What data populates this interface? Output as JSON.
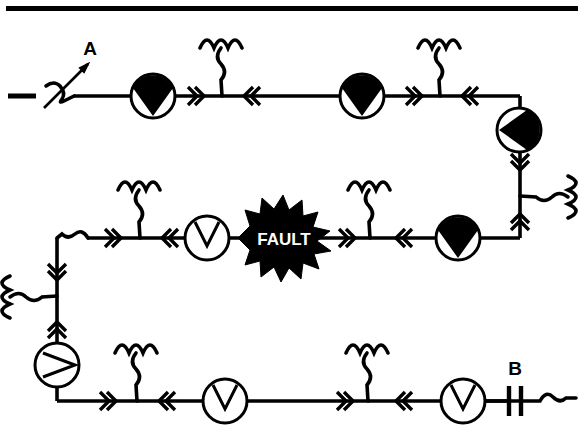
{
  "figure": {
    "type": "single-line-power-distribution-diagram",
    "title": "",
    "width": 584,
    "height": 433,
    "background_color": "#ffffff",
    "line_color": "#000000",
    "border": {
      "top_rule": true,
      "color": "#000000"
    }
  },
  "labels": {
    "switch_a": "A",
    "switch_b": "B",
    "fault": "FAULT"
  },
  "colors": {
    "stroke": "#000000",
    "fill_marker": "#000000",
    "open_marker": "#ffffff",
    "fault_fill": "#000000",
    "fault_text": "#ffffff"
  },
  "legend_semantics": {
    "filled_wedge_circle": "closed / energized switchgear",
    "open_wedge_circle": "open / de-energized switchgear",
    "double_chevron": "current direction marker",
    "coil_three_hump": "distribution transformer / load tap",
    "parallel_bars": "open circuit breaker",
    "starburst": "fault location"
  },
  "buses": [
    {
      "id": "top",
      "y": 96,
      "x1": 68,
      "x2": 520
    },
    {
      "id": "middle",
      "y": 238,
      "x1": 68,
      "x2": 520
    },
    {
      "id": "bottom",
      "y": 401,
      "x1": 57,
      "x2": 520
    }
  ],
  "devices": [
    {
      "id": "sw-a",
      "kind": "disconnect-switch",
      "label": "A",
      "x": 60,
      "y": 96,
      "state": "closed"
    },
    {
      "id": "rec-1",
      "kind": "wedge-circle",
      "x": 153,
      "y": 96,
      "state": "filled",
      "orientation": "down"
    },
    {
      "id": "xfmr-1",
      "kind": "transformer-coil",
      "x": 222,
      "y": 96,
      "orientation": "up"
    },
    {
      "id": "rec-2",
      "kind": "wedge-circle",
      "x": 362,
      "y": 96,
      "state": "filled",
      "orientation": "down"
    },
    {
      "id": "xfmr-2",
      "kind": "transformer-coil",
      "x": 440,
      "y": 96,
      "orientation": "up"
    },
    {
      "id": "rec-3",
      "kind": "wedge-circle",
      "x": 519,
      "y": 130,
      "state": "filled",
      "orientation": "right"
    },
    {
      "id": "xfmr-3",
      "kind": "transformer-coil",
      "x": 519,
      "y": 196,
      "orientation": "right"
    },
    {
      "id": "xfmr-4",
      "kind": "transformer-coil",
      "x": 140,
      "y": 238,
      "orientation": "up"
    },
    {
      "id": "rec-4",
      "kind": "wedge-circle",
      "x": 207,
      "y": 238,
      "state": "open",
      "orientation": "down"
    },
    {
      "id": "fault-1",
      "kind": "fault-starburst",
      "label": "FAULT",
      "x": 285,
      "y": 238
    },
    {
      "id": "xfmr-5",
      "kind": "transformer-coil",
      "x": 370,
      "y": 238,
      "orientation": "up"
    },
    {
      "id": "rec-5",
      "kind": "wedge-circle",
      "x": 458,
      "y": 238,
      "state": "filled",
      "orientation": "down"
    },
    {
      "id": "xfmr-6",
      "kind": "transformer-coil",
      "x": 57,
      "y": 296,
      "orientation": "left"
    },
    {
      "id": "rec-6",
      "kind": "wedge-circle",
      "x": 57,
      "y": 365,
      "state": "open",
      "orientation": "right"
    },
    {
      "id": "xfmr-7",
      "kind": "transformer-coil",
      "x": 137,
      "y": 401,
      "orientation": "up"
    },
    {
      "id": "rec-7",
      "kind": "wedge-circle",
      "x": 225,
      "y": 401,
      "state": "open",
      "orientation": "down"
    },
    {
      "id": "xfmr-8",
      "kind": "transformer-coil",
      "x": 368,
      "y": 401,
      "orientation": "up"
    },
    {
      "id": "rec-8",
      "kind": "wedge-circle",
      "x": 463,
      "y": 401,
      "state": "open",
      "orientation": "down"
    },
    {
      "id": "sw-b",
      "kind": "open-breaker",
      "label": "B",
      "x": 514,
      "y": 401,
      "state": "open"
    }
  ]
}
